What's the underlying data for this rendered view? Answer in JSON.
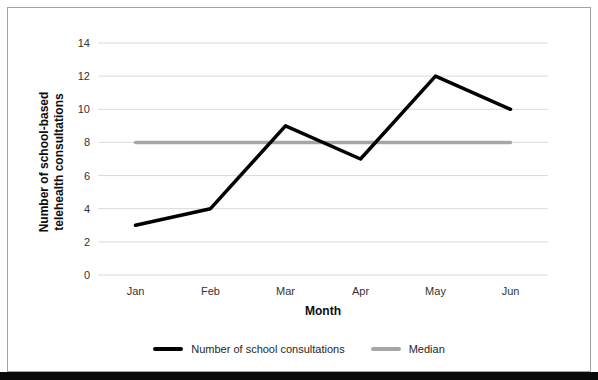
{
  "chart_data": {
    "type": "line",
    "title": "",
    "categories": [
      "Jan",
      "Feb",
      "Mar",
      "Apr",
      "May",
      "Jun"
    ],
    "series": [
      {
        "name": "Number of school consultations",
        "values": [
          3,
          4,
          9,
          7,
          12,
          10
        ],
        "color": "#000000",
        "width": 3.5
      },
      {
        "name": "Median",
        "values": [
          8,
          8,
          8,
          8,
          8,
          8
        ],
        "color": "#a6a6a6",
        "width": 3.5
      }
    ],
    "xlabel": "Month",
    "ylabel": "Number of school-based telehealth consultations",
    "ylabel_lines": [
      "Number of school-based",
      "telehealth consultations"
    ],
    "ylim": [
      0,
      14
    ],
    "ytick_step": 2,
    "y_ticks_top_to_bottom": [
      "14",
      "12",
      "10",
      "8",
      "6",
      "4",
      "2",
      "0"
    ],
    "grid": "horizontal",
    "gridline_color": "#d9d9d9",
    "legend_position": "bottom"
  },
  "figure": {
    "background": "#ffffff",
    "border_color": "#a3a3a3",
    "bottom_bar_color": "#0a0a0a"
  },
  "legend": {
    "items": [
      {
        "label": "Number of school consultations",
        "swatch_color": "#000000"
      },
      {
        "label": "Median",
        "swatch_color": "#a6a6a6"
      }
    ]
  }
}
